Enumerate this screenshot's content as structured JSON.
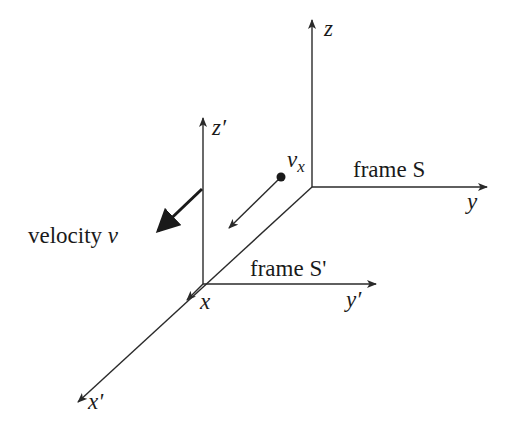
{
  "diagram": {
    "frame_S": {
      "label": "frame S",
      "axes": {
        "x": "x'",
        "y": "y",
        "z": "z"
      }
    },
    "frame_S_prime": {
      "label": "frame S'",
      "axes": {
        "x": "x",
        "y": "y′",
        "z": "z′"
      }
    },
    "velocity": {
      "label": "velocity",
      "symbol": "v"
    },
    "particle": {
      "label_main": "v",
      "label_sub": "x"
    },
    "colors": {
      "line": "#2a2a2a",
      "text": "#1a1a1a",
      "background": "#ffffff"
    }
  }
}
